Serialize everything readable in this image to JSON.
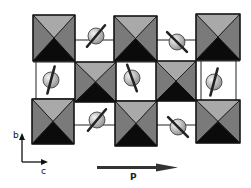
{
  "diagram": {
    "title": "",
    "colors": {
      "top_face": "#a9a9a9",
      "side_face": "#7a7a7a",
      "bottom_face": "#0b0b0b",
      "edge": "#111111",
      "sphere_light": "#e6e6e6",
      "sphere_dark": "#9a9a9a",
      "bond": "#222222",
      "arrow": "#333333"
    },
    "octahedra": [
      {
        "id": "oct-top-1",
        "x": 33,
        "y": 15,
        "w": 42,
        "h": 46
      },
      {
        "id": "oct-top-2",
        "x": 114,
        "y": 16,
        "w": 43,
        "h": 45
      },
      {
        "id": "oct-top-3",
        "x": 196,
        "y": 14,
        "w": 44,
        "h": 46
      },
      {
        "id": "oct-mid-1",
        "x": 75,
        "y": 62,
        "w": 41,
        "h": 40
      },
      {
        "id": "oct-mid-2",
        "x": 156,
        "y": 61,
        "w": 40,
        "h": 40
      },
      {
        "id": "oct-bot-1",
        "x": 32,
        "y": 99,
        "w": 42,
        "h": 45
      },
      {
        "id": "oct-bot-2",
        "x": 115,
        "y": 101,
        "w": 42,
        "h": 45
      },
      {
        "id": "oct-bot-3",
        "x": 196,
        "y": 100,
        "w": 44,
        "h": 43
      }
    ],
    "spheres": [
      {
        "id": "atom-top-1",
        "cx": 96,
        "cy": 36,
        "r": 8,
        "bar_angle": -50
      },
      {
        "id": "atom-top-2",
        "cx": 177,
        "cy": 42,
        "r": 8,
        "bar_angle": 45
      },
      {
        "id": "atom-mid-1",
        "cx": 51,
        "cy": 80,
        "r": 8,
        "bar_angle": -75
      },
      {
        "id": "atom-mid-2",
        "cx": 132,
        "cy": 78,
        "r": 8,
        "bar_angle": 70
      },
      {
        "id": "atom-mid-3",
        "cx": 214,
        "cy": 82,
        "r": 8,
        "bar_angle": -75
      },
      {
        "id": "atom-bot-1",
        "cx": 97,
        "cy": 120,
        "r": 8,
        "bar_angle": -50
      },
      {
        "id": "atom-bot-2",
        "cx": 178,
        "cy": 127,
        "r": 8,
        "bar_angle": 45
      }
    ],
    "axes": {
      "vertical_label": "b",
      "horizontal_label": "c"
    },
    "polarization": {
      "label": "P"
    }
  }
}
